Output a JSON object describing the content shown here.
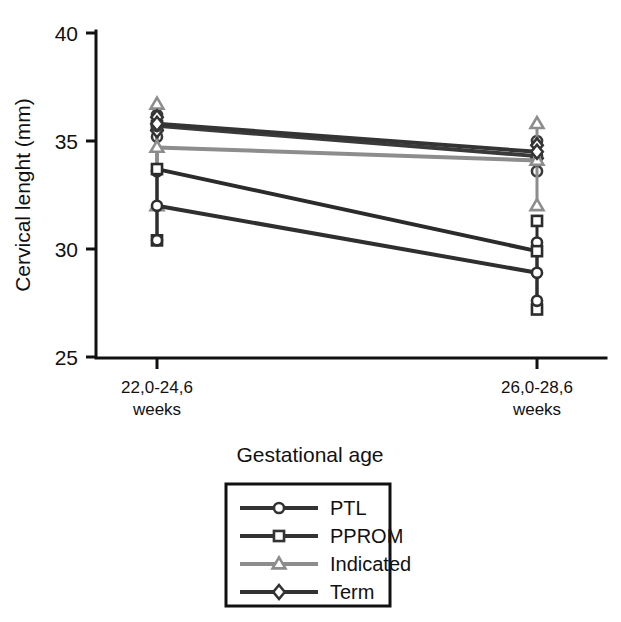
{
  "chart_data": {
    "type": "line",
    "title": "",
    "xlabel": "Gestational age",
    "ylabel": "Cervical lenght (mm)",
    "categories": [
      "22,0-24,6\nweeks",
      "26,0-28,6\nweeks"
    ],
    "category_labels": [
      {
        "line1": "22,0-24,6",
        "line2": "weeks"
      },
      {
        "line1": "26,0-28,6",
        "line2": "weeks"
      }
    ],
    "ylim": [
      25,
      40
    ],
    "yticks": [
      25,
      30,
      35,
      40
    ],
    "ytick_labels": [
      "25",
      "30",
      "35",
      "40"
    ],
    "grid": false,
    "legend_position": "below-plot",
    "series": [
      {
        "name": "PTL",
        "marker": "circle",
        "color": "#3a3a3a",
        "values": [
          35.7,
          34.3
        ],
        "errors_low": [
          35.2,
          33.6
        ],
        "errors_high": [
          36.2,
          35.0
        ]
      },
      {
        "name": "PPROM",
        "marker": "square",
        "color": "#2b2b2b",
        "values": [
          33.7,
          29.9
        ],
        "errors_low": [
          30.4,
          27.2
        ],
        "errors_high": [
          35.7,
          31.3
        ]
      },
      {
        "name": "Indicated",
        "marker": "triangle",
        "color": "#8d8d8d",
        "values": [
          34.7,
          34.1
        ],
        "errors_low": [
          32.0,
          32.0
        ],
        "errors_high": [
          36.7,
          35.8
        ]
      },
      {
        "name": "Term",
        "marker": "diamond",
        "color": "#343434",
        "values": [
          35.8,
          34.5
        ],
        "errors_low": [
          35.5,
          34.2
        ],
        "errors_high": [
          36.1,
          34.8
        ]
      },
      {
        "name": "PTL-lower",
        "marker": "circle",
        "color": "#2f2f2f",
        "values": [
          32.0,
          28.9
        ],
        "errors_low": [
          30.4,
          27.6
        ],
        "errors_high": [
          33.6,
          30.3
        ]
      }
    ],
    "legend_entries": [
      {
        "label": "PTL",
        "marker": "circle",
        "color": "#333333"
      },
      {
        "label": "PPROM",
        "marker": "square",
        "color": "#333333"
      },
      {
        "label": "Indicated",
        "marker": "triangle",
        "color": "#8d8d8d"
      },
      {
        "label": "Term",
        "marker": "diamond",
        "color": "#333333"
      }
    ]
  },
  "colors": {
    "axis": "#111111",
    "dark_series": "#333333",
    "light_series": "#8d8d8d",
    "background": "#ffffff"
  }
}
